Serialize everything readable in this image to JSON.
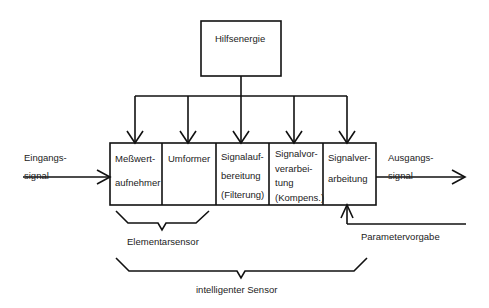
{
  "diagram": {
    "type": "block-diagram",
    "supply": {
      "label": "Hilfsenergie"
    },
    "input": {
      "label_line1": "Eingangs-",
      "label_line2": "signal"
    },
    "output": {
      "label_line1": "Ausgangs-",
      "label_line2": "signal"
    },
    "parameter": {
      "label": "Parametervorgabe"
    },
    "blocks": [
      {
        "lines": [
          "Meßwert-",
          "aufnehmer"
        ]
      },
      {
        "lines": [
          "Umformer"
        ]
      },
      {
        "lines": [
          "Signalauf-",
          "bereitung",
          "(Filterung)"
        ]
      },
      {
        "lines": [
          "Signalvor-",
          "verarbei-",
          "tung",
          "(Kompens.)"
        ]
      },
      {
        "lines": [
          "Signalver-",
          "arbeitung"
        ]
      }
    ],
    "groups": [
      {
        "label": "Elementarsensor"
      },
      {
        "label": "intelligenter Sensor"
      }
    ],
    "colors": {
      "line": "#111111",
      "background": "#ffffff",
      "text": "#222222"
    }
  }
}
